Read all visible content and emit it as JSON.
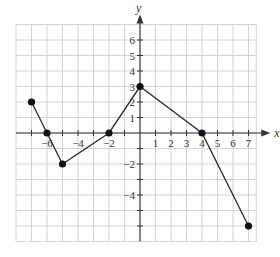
{
  "chart_data": {
    "type": "line",
    "title": "",
    "xlabel": "x",
    "ylabel": "y",
    "xlim": [
      -8,
      7.5
    ],
    "ylim": [
      -7,
      7
    ],
    "grid": true,
    "x_tick_labels": [
      "-6",
      "-4",
      "-2",
      "1",
      "2",
      "3",
      "4",
      "5",
      "6",
      "7"
    ],
    "x_tick_values": [
      -6,
      -4,
      -2,
      1,
      2,
      3,
      4,
      5,
      6,
      7
    ],
    "y_tick_labels": [
      "6",
      "5",
      "4",
      "3",
      "2",
      "1",
      "-2",
      "-4"
    ],
    "y_tick_values": [
      6,
      5,
      4,
      3,
      2,
      1,
      -2,
      -4
    ],
    "series": [
      {
        "name": "f",
        "points": [
          [
            -7,
            2
          ],
          [
            -6,
            0
          ],
          [
            -5,
            -2
          ],
          [
            -2,
            0
          ],
          [
            0,
            3
          ],
          [
            4,
            0
          ],
          [
            7,
            -6
          ]
        ],
        "x": [
          -7,
          -6,
          -5,
          -2,
          0,
          4,
          7
        ],
        "values": [
          2,
          0,
          -2,
          0,
          3,
          0,
          -6
        ],
        "markers": "filled-circle",
        "color": "#222222"
      }
    ]
  },
  "layout": {
    "origin_px": [
      140,
      133
    ],
    "unit_px": 15.5,
    "grid_color": "#c9c9c9",
    "axis_color": "#333333"
  }
}
